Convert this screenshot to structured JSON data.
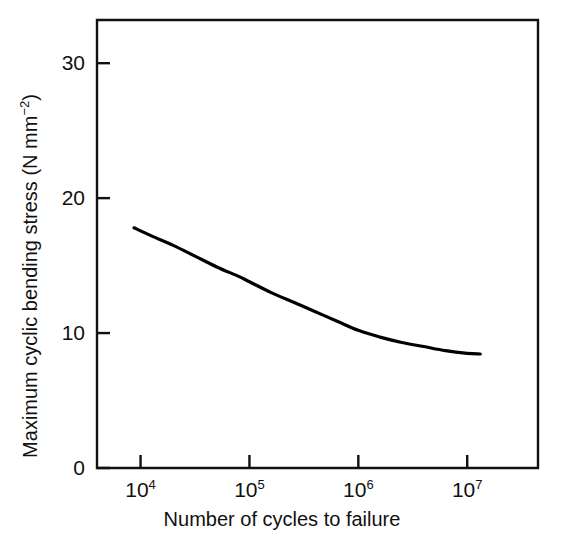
{
  "chart_data": {
    "type": "line",
    "title": "",
    "subtitle": "",
    "xlabel": "Number of cycles to failure",
    "ylabel": "Maximum cyclic bending stress (N mm−2)",
    "ylabel_text": "Maximum cyclic bending stress (N mm",
    "ylabel_sup": "−2",
    "ylabel_tail": ")",
    "x_scale": "log10",
    "y_scale": "linear",
    "xlim": [
      3.6,
      7.65
    ],
    "ylim": [
      0,
      33.2
    ],
    "grid": false,
    "legend": null,
    "legend_position": "none",
    "frame": "box",
    "y_ticks": [
      {
        "value": 0,
        "label": "0"
      },
      {
        "value": 10,
        "label": "10"
      },
      {
        "value": 20,
        "label": "20"
      },
      {
        "value": 30,
        "label": "30"
      }
    ],
    "x_ticks": [
      {
        "value": 4,
        "base": "10",
        "exponent": "4",
        "label": "10⁴"
      },
      {
        "value": 5,
        "base": "10",
        "exponent": "5",
        "label": "10⁵"
      },
      {
        "value": 6,
        "base": "10",
        "exponent": "6",
        "label": "10⁶"
      },
      {
        "value": 7,
        "base": "10",
        "exponent": "7",
        "label": "10⁷"
      }
    ],
    "series": [
      {
        "name": "S-N fatigue curve",
        "color": "#000000",
        "line_width": 3.2,
        "x_log10": [
          3.94,
          4.1,
          4.3,
          4.5,
          4.7,
          4.9,
          5.0,
          5.2,
          5.4,
          5.6,
          5.8,
          6.0,
          6.2,
          6.4,
          6.6,
          6.8,
          7.0,
          7.12
        ],
        "values": [
          17.8,
          17.2,
          16.5,
          15.7,
          14.9,
          14.2,
          13.8,
          13.0,
          12.3,
          11.6,
          10.9,
          10.2,
          9.7,
          9.3,
          9.0,
          8.7,
          8.5,
          8.45
        ]
      }
    ],
    "annotations": []
  },
  "axes": {
    "y_title": "Maximum cyclic bending stress (N mm",
    "y_title_sup": "−2",
    "y_title_end": ")",
    "x_title": "Number of cycles to failure"
  },
  "colors": {
    "background": "#ffffff",
    "axis": "#111111",
    "curve": "#000000",
    "text": "#111111"
  }
}
